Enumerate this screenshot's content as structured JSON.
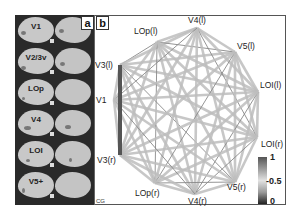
{
  "figure": {
    "panels": {
      "a": {
        "letter": "a",
        "rois": [
          "V1",
          "V2/3v",
          "LOp",
          "V4",
          "LOI",
          "V5+"
        ]
      },
      "b": {
        "letter": "b",
        "corner_label": "CG"
      }
    },
    "nodes": [
      {
        "id": "V3l",
        "label": "V3(l)",
        "x": 120,
        "y": 65,
        "lx": 95,
        "ly": 68
      },
      {
        "id": "LOpl",
        "label": "LOp(l)",
        "x": 157,
        "y": 42,
        "lx": 134,
        "ly": 34
      },
      {
        "id": "V4l",
        "label": "V4(l)",
        "x": 197,
        "y": 28,
        "lx": 188,
        "ly": 23
      },
      {
        "id": "V5l",
        "label": "V5(l)",
        "x": 235,
        "y": 52,
        "lx": 237,
        "ly": 49
      },
      {
        "id": "LOIl",
        "label": "LOI(l)",
        "x": 258,
        "y": 92,
        "lx": 260,
        "ly": 88
      },
      {
        "id": "LOIr",
        "label": "LOI(r)",
        "x": 257,
        "y": 137,
        "lx": 261,
        "ly": 147
      },
      {
        "id": "V5r",
        "label": "V5(r)",
        "x": 235,
        "y": 182,
        "lx": 227,
        "ly": 190
      },
      {
        "id": "V4r",
        "label": "V4(r)",
        "x": 195,
        "y": 194,
        "lx": 188,
        "ly": 204
      },
      {
        "id": "LOpr",
        "label": "LOp(r)",
        "x": 155,
        "y": 183,
        "lx": 135,
        "ly": 196
      },
      {
        "id": "V3r",
        "label": "V3(r)",
        "x": 120,
        "y": 155,
        "lx": 97,
        "ly": 163
      },
      {
        "id": "V1",
        "label": "V1",
        "x": 114,
        "y": 100,
        "lx": 96,
        "ly": 103
      }
    ],
    "strong_edge": {
      "from": "V3l",
      "to": "V3r",
      "color": "#555555"
    },
    "colorbar": {
      "ticks": [
        "1",
        "-0.5",
        "0"
      ],
      "top_color": "#555555",
      "mid_color": "#dddddd",
      "bottom_color": "#222222"
    },
    "edge_color": "#bdbdbd",
    "edge_dark_color": "#8a8a8a"
  },
  "chart_data": {
    "type": "network",
    "title": "",
    "nodes": [
      "V3(l)",
      "LOp(l)",
      "V4(l)",
      "V5(l)",
      "LOI(l)",
      "LOI(r)",
      "V5(r)",
      "V4(r)",
      "LOp(r)",
      "V3(r)",
      "V1"
    ],
    "edges": "fully connected; grayscale encodes correlation 0–1; strongest visible edge V3(l)–V3(r)",
    "colorbar": {
      "min": 0,
      "mid": 0.5,
      "max": 1,
      "tick_labels": [
        "1",
        "-0.5",
        "0"
      ]
    }
  }
}
